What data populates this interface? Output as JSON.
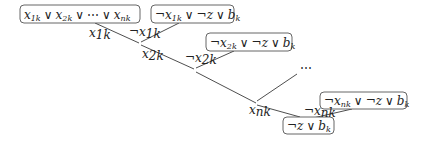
{
  "diagram": {
    "type": "resolution-tree",
    "nodes": [
      {
        "id": "c1",
        "text": "x1k ∨ x2k ∨ ⋯ ∨ xnk",
        "parts": [
          [
            "x",
            "1k"
          ],
          [
            "∨"
          ],
          [
            "x",
            "2k"
          ],
          [
            "∨"
          ],
          [
            "⋯"
          ],
          [
            "∨"
          ],
          [
            "x",
            "nk"
          ]
        ]
      },
      {
        "id": "c2",
        "text": "¬x1k ∨ ¬z ∨ bk"
      },
      {
        "id": "c3",
        "text": "¬x2k ∨ ¬z ∨ bk"
      },
      {
        "id": "c4",
        "text": "¬xnk ∨ ¬z ∨ bk"
      },
      {
        "id": "c5",
        "text": "¬z ∨ bk"
      }
    ],
    "edge_labels": [
      {
        "id": "l1",
        "text": "x1k"
      },
      {
        "id": "l2",
        "text": "¬x1k"
      },
      {
        "id": "l3",
        "text": "x2k"
      },
      {
        "id": "l4",
        "text": "¬x2k"
      },
      {
        "id": "l5",
        "text": "xnk"
      },
      {
        "id": "l6",
        "text": "¬xnk"
      }
    ],
    "ellipsis": "⋯",
    "symbols": {
      "neg": "¬",
      "or": "∨",
      "dots": "⋯",
      "x": "x",
      "z": "z",
      "b": "b",
      "sub1k": "1k",
      "sub2k": "2k",
      "subnk": "nk",
      "subk": "k"
    }
  }
}
